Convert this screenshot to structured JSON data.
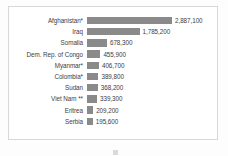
{
  "chart_data": {
    "type": "bar",
    "orientation": "horizontal",
    "title": "",
    "xlabel": "",
    "ylabel": "",
    "grid": false,
    "legend_position": "bottom",
    "xlim": [
      0,
      2887100
    ],
    "categories": [
      "Afghanistan*",
      "Iraq",
      "Somalia",
      "Dem. Rep. of Congo",
      "Myanmar*",
      "Colombia*",
      "Sudan",
      "Viet Nam **",
      "Eritrea",
      "Serbia"
    ],
    "values": [
      2887100,
      1785200,
      678300,
      455900,
      406700,
      389800,
      368200,
      339300,
      209200,
      195600
    ],
    "value_labels": [
      "2,887,100",
      "1,785,200",
      "678,300",
      "455,900",
      "406,700",
      "389,800",
      "368,200",
      "339,300",
      "209,200",
      "195,600"
    ],
    "bar_color": "#8a8a8a"
  },
  "legend": {
    "label": "",
    "swatch_color": "#8a8a8a"
  },
  "colors": {
    "bar": "#8a8a8a",
    "frame_border": "#d8d8d8",
    "page_background": "#fdfdfd",
    "chart_background": "#ffffff",
    "text": "#3d3d3d"
  }
}
